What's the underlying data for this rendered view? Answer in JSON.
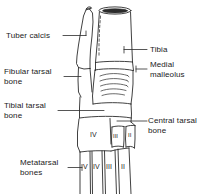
{
  "figure": {
    "background_color": "#ffffff",
    "line_color": "#2b2b2b",
    "text_color": "#1a1a1a"
  },
  "labels": {
    "tuber_calcis": "Tuber calcis",
    "fibular_tarsal_line1": "Fibular tarsal",
    "fibular_tarsal_line2": "bone",
    "tibial_tarsal_line1": "Tibial tarsal",
    "tibial_tarsal_line2": "bone",
    "metatarsal_line1": "Metatarsal",
    "metatarsal_line2": "bones",
    "tibia": "Tibia",
    "medial_malleolus_line1": "Medial",
    "medial_malleolus_line2": "malleolus",
    "central_tarsal_line1": "Central tarsal",
    "central_tarsal_line2": "bone"
  },
  "bone_numerals": {
    "tarsal_iv": "IV",
    "tarsal_iii": "III",
    "tarsal_ii": "II",
    "metatarsal_v": "V",
    "metatarsal_iv": "IV",
    "metatarsal_iii": "III",
    "metatarsal_ii": "II"
  }
}
